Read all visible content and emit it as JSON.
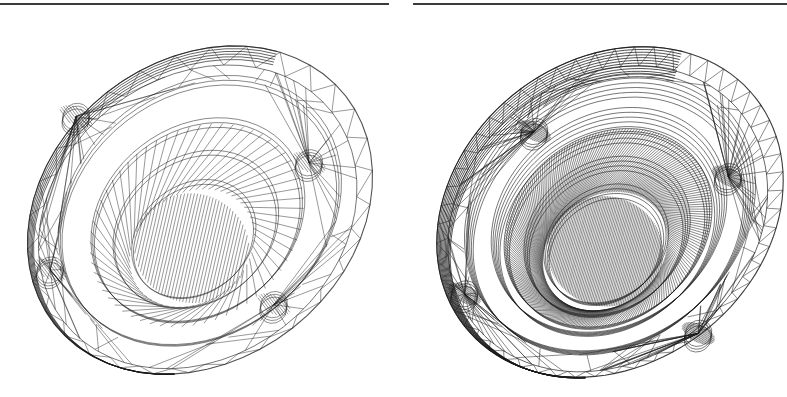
{
  "figure": {
    "background": "#ffffff",
    "line_color": "#1a1a1a",
    "rules": [
      {
        "x": 0,
        "width": 389
      },
      {
        "x": 413,
        "width": 374
      }
    ],
    "panels": [
      {
        "name": "coarse-mesh",
        "x": 0,
        "width": 395,
        "center": [
          200,
          210
        ],
        "outer_radius": [
          185,
          150
        ],
        "tilt_deg": -38,
        "ring_steps": 60,
        "inner_rings": [
          0.82,
          0.62,
          0.48,
          0.36
        ],
        "hub_offset": [
          -30,
          25
        ],
        "bolt_holes": [
          [
            -40,
            -150
          ],
          [
            -155,
            -45
          ],
          [
            115,
            30
          ],
          [
            0,
            120
          ]
        ],
        "stroke_opacity": 0.75,
        "density": 1
      },
      {
        "name": "refined-mesh",
        "x": 398,
        "width": 389,
        "center": [
          212,
          212
        ],
        "outer_radius": [
          185,
          152
        ],
        "tilt_deg": -38,
        "ring_steps": 110,
        "inner_rings": [
          0.84,
          0.68,
          0.6,
          0.48,
          0.36
        ],
        "hub_offset": [
          -28,
          28
        ],
        "bolt_holes": [
          [
            -10,
            -110
          ],
          [
            -165,
            -25
          ],
          [
            115,
            45
          ],
          [
            -5,
            150
          ]
        ],
        "stroke_opacity": 0.85,
        "density": 2
      }
    ]
  }
}
